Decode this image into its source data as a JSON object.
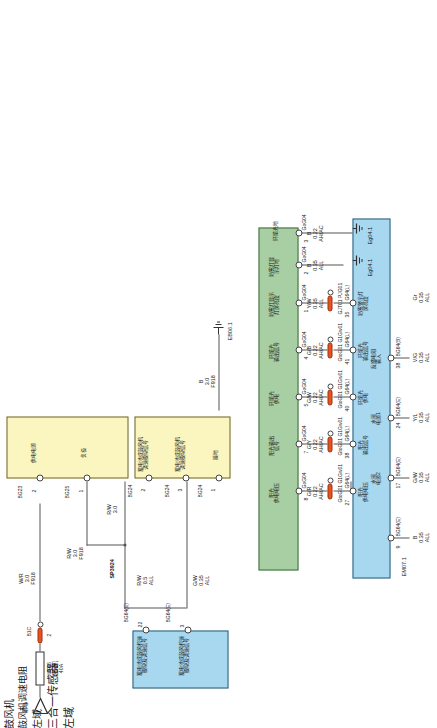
{
  "diagram": {
    "orientation": "rotated-90"
  },
  "colors": {
    "yellow": "#fbf6bf",
    "blue": "#a8d8f0",
    "green": "#a8cfa4",
    "pink": "#f6c6d8",
    "connector": "#e8521f",
    "wire": "#555555"
  },
  "blocks": {
    "blower": {
      "name": "鼓风机",
      "pins": [
        {
          "no": "2",
          "label": "供电电源",
          "code": "BG23"
        },
        {
          "no": "1",
          "label": "负极",
          "code": "BG25"
        }
      ]
    },
    "blower_resistor": {
      "name": "鼓风机调速电阻",
      "pins": [
        {
          "no": "2",
          "label": "蓄电池或鼓风机\n调速模块信号",
          "code": "BG24"
        },
        {
          "no": "3",
          "label": "蓄电池或鼓风机\n调速模块信号",
          "code": "BG24"
        },
        {
          "no": "1",
          "label": "接地",
          "code": "BG24"
        }
      ]
    },
    "left_domain_top": {
      "name": "左域",
      "pins": [
        {
          "no": "22",
          "label": "蓄电池或鼓风机速\n模块及调速信号",
          "code": "BG64(E)"
        },
        {
          "no": "3",
          "label": "蓄电池或鼓风机速\n模块及调速信号",
          "code": "BG64(E)"
        }
      ]
    },
    "sensor_3in1": {
      "name": "三合一传感器",
      "pins": [
        {
          "no": "8",
          "label": "阳光\n供电电压",
          "code": "GoG04"
        },
        {
          "no": "7",
          "label": "阳光输出\n信号",
          "code": "GoG04"
        },
        {
          "no": "5",
          "label": "环境光\n供电",
          "code": "GoG04"
        },
        {
          "no": "4",
          "label": "环境光\n输出信号",
          "code": "GoG04"
        },
        {
          "no": "1",
          "label": "防雾灯显示\n灯屏亮度",
          "code": "GoG04"
        },
        {
          "no": "2",
          "label": "防雾灯显\n示灯地",
          "code": "GoG04"
        },
        {
          "no": "3",
          "label": "环境光地",
          "code": "GoG04"
        }
      ]
    },
    "left_domain_main": {
      "name": "左域",
      "pins_top": [
        {
          "no": "27",
          "label": "阳光\n供电电压",
          "code": "G64(L)"
        },
        {
          "no": "38",
          "label": "阳光\n输出信号",
          "code": "G64(L)"
        },
        {
          "no": "40",
          "label": "环境光\n供电",
          "code": "G64(L)"
        },
        {
          "no": "41",
          "label": "环境光\n输出信号",
          "code": "G64(L)"
        },
        {
          "no": "35",
          "label": "防雾警示灯\n屏亮度",
          "code": "G64(L)"
        }
      ],
      "pins_bottom": [
        {
          "no": "9",
          "label": "",
          "code": "BG64(E)"
        },
        {
          "no": "17",
          "label": "水阀\n电源2",
          "code": "BG64(E)"
        },
        {
          "no": "24",
          "label": "水阀\n电源1",
          "code": "BG64(E)"
        },
        {
          "no": "38",
          "label": "反馈电阻\n输入",
          "code": "BG64(B)"
        }
      ]
    },
    "water_valve": {
      "name": "三通水阀",
      "pins": [
        {
          "no": "5",
          "label": "水阀控制\n电源2",
          "code": "B56"
        },
        {
          "no": "4",
          "label": "水阀控制\n电源1",
          "code": "B56"
        },
        {
          "no": "3",
          "label": "反馈电源",
          "code": "B56"
        },
        {
          "no": "2",
          "label": "电源反馈",
          "code": "B56"
        },
        {
          "no": "1",
          "label": "GND",
          "code": "B56"
        }
      ]
    },
    "humidity_sensor": {
      "name": "湿度传感器",
      "pins": [
        {
          "no": "3",
          "label": "LIN",
          "code": "P17"
        },
        {
          "no": "1",
          "label": "12V电",
          "code": "P17"
        },
        {
          "no": "2",
          "label": "地",
          "code": "P17"
        }
      ]
    }
  },
  "fuses": [
    {
      "id": "UF45",
      "name": "鼓风机",
      "rating": "40A"
    },
    {
      "id": "UF37",
      "name": "ETC",
      "rating": "7.5A"
    }
  ],
  "sources": [
    {
      "label": "常电"
    },
    {
      "label": "IG1"
    }
  ],
  "grounds": [
    {
      "label": "EB06.1"
    },
    {
      "label": "Eg04.1"
    },
    {
      "label": "EM07.1"
    },
    {
      "label": "Ep01"
    }
  ],
  "splices": [
    {
      "label": "SP3924"
    }
  ],
  "wires": [
    {
      "id": "w1",
      "color": "W/R",
      "size": "3.0",
      "code": "F918",
      "market": "ALL"
    },
    {
      "id": "w2",
      "color": "R/W",
      "size": "3.0",
      "code": "F918",
      "market": "ALL"
    },
    {
      "id": "w3",
      "color": "R/W",
      "size": "0.5",
      "code": "",
      "market": "ALL"
    },
    {
      "id": "w4",
      "color": "G/W",
      "size": "0.35",
      "code": "",
      "market": "ALL"
    },
    {
      "id": "w5",
      "color": "B",
      "size": "3.0",
      "code": "F918",
      "market": "ALL"
    },
    {
      "id": "w6",
      "color": "G/R",
      "size": "0.22",
      "code": "",
      "market": "AH/AC"
    },
    {
      "id": "w7",
      "color": "G/Y",
      "size": "0.22",
      "code": "",
      "market": "AH/AC"
    },
    {
      "id": "w8",
      "color": "G/W",
      "size": "0.22",
      "code": "",
      "market": "AH/AC"
    },
    {
      "id": "w9",
      "color": "G/B",
      "size": "0.22",
      "code": "",
      "market": "AH/AC"
    },
    {
      "id": "w10",
      "color": "Y/W",
      "size": "0.35",
      "code": "",
      "market": "ALL"
    },
    {
      "id": "w11",
      "color": "B",
      "size": "0.35",
      "code": "",
      "market": "ALL"
    },
    {
      "id": "w12",
      "color": "B",
      "size": "0.22",
      "code": "",
      "market": "AH/AC"
    },
    {
      "id": "w13",
      "color": "Gr",
      "size": "0.35",
      "code": "",
      "market": "ALL"
    },
    {
      "id": "w14",
      "color": "V/G",
      "size": "0.35",
      "code": "",
      "market": "ALL"
    },
    {
      "id": "w15",
      "color": "Y/L",
      "size": "0.35",
      "code": "",
      "market": "ALL"
    },
    {
      "id": "w16",
      "color": "G/W",
      "size": "0.35",
      "code": "",
      "market": "ALL"
    },
    {
      "id": "w17",
      "color": "B",
      "size": "0.35",
      "code": "",
      "market": "ALL"
    },
    {
      "id": "w18",
      "color": "Gr/R",
      "size": "0.35",
      "code": "",
      "market": "ALL"
    },
    {
      "id": "w19",
      "color": "Gr/R",
      "size": "0.35",
      "code": "",
      "market": "ALL"
    },
    {
      "id": "w20",
      "color": "Gr/R",
      "size": "0.35",
      "code": "",
      "market": "ALL"
    },
    {
      "id": "w21",
      "color": "HS",
      "size": "",
      "code": "",
      "market": ""
    },
    {
      "id": "w22",
      "color": "B",
      "size": "0.35",
      "code": "",
      "market": "ALL"
    }
  ],
  "inline_connectors": [
    {
      "id": "c1",
      "code": "B1C",
      "pins": "2"
    },
    {
      "id": "c2",
      "code": "GtoG01\nG1Gw01",
      "pins": "5"
    },
    {
      "id": "c3",
      "code": "GtoG01\nG1Gw01",
      "pins": "4"
    },
    {
      "id": "c4",
      "code": "GtoG01\nG1Gw01",
      "pins": "3"
    },
    {
      "id": "c5",
      "code": "GtoG01\nG1Gw01",
      "pins": "2"
    },
    {
      "id": "c6",
      "code": "GJT01\nPJG01",
      "pins": "6"
    },
    {
      "id": "c7",
      "code": "BIG01\nGDB01",
      "pins": "21"
    },
    {
      "id": "c8",
      "code": "BIC",
      "pins": "11"
    },
    {
      "id": "c9",
      "code": "BJC01\nGDB01",
      "pins": "13"
    },
    {
      "id": "c10",
      "code": "GJP01\nPJG01",
      "pins": "4"
    },
    {
      "id": "c11",
      "code": "GJP01\nPJG01",
      "pins": "3"
    }
  ],
  "annotations": {
    "left_domain_ref": "左域BG64(B)-3",
    "eg_ref_1": "Eg04.1",
    "eg_ref_2": "Eg04.1",
    "em_ref": "EM07.1",
    "eb_ref": "EB06.1",
    "ep_ref": "Ep01"
  }
}
